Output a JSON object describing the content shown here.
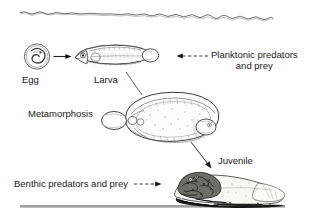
{
  "figure": {
    "background_color": "#ffffff",
    "ink_color": "#1a1a1a",
    "width": 314,
    "height": 223
  },
  "labels": {
    "egg": "Egg",
    "larva": "Larva",
    "metamorphosis": "Metamorphosis",
    "juvenile": "Juvenile",
    "planktonic_line1": "Planktonic predators",
    "planktonic_line2": "and prey",
    "benthic": "Benthic predators and prey"
  },
  "scene": {
    "water_surface": "wavy-line",
    "seafloor": "straight-line"
  },
  "stages": [
    {
      "name": "egg",
      "icon": "fish-egg-icon",
      "label": "Egg"
    },
    {
      "name": "larva",
      "icon": "fish-larva-icon",
      "label": "Larva"
    },
    {
      "name": "metamorphosis",
      "icon": "flatfish-metamorphosis-icon",
      "label": "Metamorphosis"
    },
    {
      "name": "juvenile",
      "icon": "benthic-juvenile-flatfish-icon",
      "label": "Juvenile"
    }
  ],
  "connectors": [
    {
      "name": "egg-to-larva",
      "style": "solid",
      "direction": "right"
    },
    {
      "name": "larva-to-metamorphosis",
      "style": "solid-line",
      "direction": "down-right"
    },
    {
      "name": "metamorphosis-to-juvenile",
      "style": "solid",
      "direction": "down-right"
    },
    {
      "name": "planktonic-pointer",
      "style": "dashed",
      "direction": "left"
    },
    {
      "name": "benthic-pointer",
      "style": "dashed",
      "direction": "right"
    }
  ]
}
